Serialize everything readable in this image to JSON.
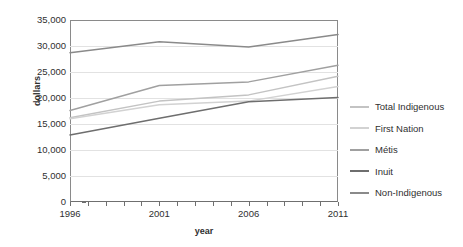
{
  "chart_data": {
    "type": "line",
    "title": "",
    "xlabel": "year",
    "ylabel": "dollars",
    "x": [
      1996,
      2001,
      2006,
      2011
    ],
    "xtick_labels": [
      "1996",
      "2001",
      "2006",
      "2011"
    ],
    "xlim": [
      1996,
      2011
    ],
    "ylim": [
      0,
      35000
    ],
    "ytick_labels": [
      "0",
      "5,000",
      "10,000",
      "15,000",
      "20,000",
      "25,000",
      "30,000",
      "35,000"
    ],
    "ytick_values": [
      0,
      5000,
      10000,
      15000,
      20000,
      25000,
      30000,
      35000
    ],
    "grid": true,
    "legend_position": "right",
    "series": [
      {
        "name": "Total Indigenous",
        "color": "#c3c3c3",
        "values": [
          16200,
          19400,
          20600,
          24200
        ]
      },
      {
        "name": "First Nation",
        "color": "#d2d2d2",
        "values": [
          16000,
          18700,
          19400,
          22200
        ]
      },
      {
        "name": "Métis",
        "color": "#a0a0a0",
        "values": [
          17600,
          22400,
          23100,
          26300
        ]
      },
      {
        "name": "Inuit",
        "color": "#6e6e6e",
        "values": [
          12900,
          16100,
          19300,
          20100
        ]
      },
      {
        "name": "Non-Indigenous",
        "color": "#8a8a8a",
        "values": [
          28700,
          30800,
          29800,
          32200
        ]
      }
    ]
  },
  "legend": {
    "items": [
      {
        "label": "Total Indigenous"
      },
      {
        "label": "First Nation"
      },
      {
        "label": "Métis"
      },
      {
        "label": "Inuit"
      },
      {
        "label": "Non-Indigenous"
      }
    ]
  }
}
